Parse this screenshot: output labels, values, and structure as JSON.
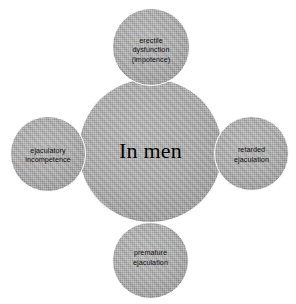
{
  "diagram": {
    "type": "radial-hub-and-spoke",
    "background_color": "#ffffff",
    "node_fill_color": "#a9a9a9",
    "node_border_color": "#ffffff",
    "text_color": "#111111",
    "hub": {
      "label": "In men"
    },
    "satellites": [
      {
        "position": "top",
        "label": "erectile\ndysfunction\n(impotence)",
        "lines": [
          "erectile",
          "dysfunction",
          "(impotence)"
        ]
      },
      {
        "position": "left",
        "label": "ejaculatory\nincompetence",
        "lines": [
          "ejaculatory",
          "incompetence"
        ]
      },
      {
        "position": "right",
        "label": "retarded\nejaculation",
        "lines": [
          "retarded",
          "ejaculation"
        ]
      },
      {
        "position": "bottom",
        "label": "premature\nejaculation",
        "lines": [
          "premature",
          "ejaculation"
        ]
      }
    ]
  }
}
